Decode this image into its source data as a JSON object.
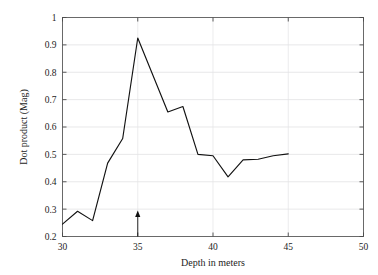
{
  "chart_data": {
    "type": "line",
    "title": "",
    "xlabel": "Depth in meters",
    "ylabel": "Dot product (Mag)",
    "xlim": [
      30,
      50
    ],
    "ylim": [
      0.2,
      1
    ],
    "xticks": [
      30,
      35,
      40,
      45,
      50
    ],
    "yticks": [
      0.2,
      0.3,
      0.4,
      0.5,
      0.6,
      0.7,
      0.8,
      0.9,
      1
    ],
    "xticklabels": [
      "30",
      "35",
      "40",
      "45",
      "50"
    ],
    "yticklabels": [
      "0.2",
      "0.3",
      "0.4",
      "0.5",
      "0.6",
      "0.7",
      "0.8",
      "0.9",
      "1"
    ],
    "grid": "horizontal-and-vertical-light",
    "legend": "none",
    "x": [
      30,
      31,
      32,
      33,
      34,
      35,
      36,
      37,
      38,
      39,
      40,
      41,
      42,
      43,
      44,
      45
    ],
    "values": [
      0.245,
      0.292,
      0.258,
      0.468,
      0.558,
      0.925,
      0.79,
      0.655,
      0.675,
      0.5,
      0.495,
      0.418,
      0.48,
      0.482,
      0.495,
      0.502
    ],
    "series": [
      {
        "name": "Dot product (Mag)",
        "values": [
          0.245,
          0.292,
          0.258,
          0.468,
          0.558,
          0.925,
          0.79,
          0.655,
          0.675,
          0.5,
          0.495,
          0.418,
          0.48,
          0.482,
          0.495,
          0.502
        ]
      }
    ],
    "annotations": [
      {
        "type": "arrow",
        "label": "",
        "x": 35,
        "y_base": 0.2,
        "y_tip": 0.295,
        "direction": "up"
      }
    ],
    "colors": {
      "line": "#121212",
      "grid": "#dededf",
      "frame": "#5a5a5a",
      "text": "#1d1d1d",
      "background": "#ffffff"
    }
  }
}
